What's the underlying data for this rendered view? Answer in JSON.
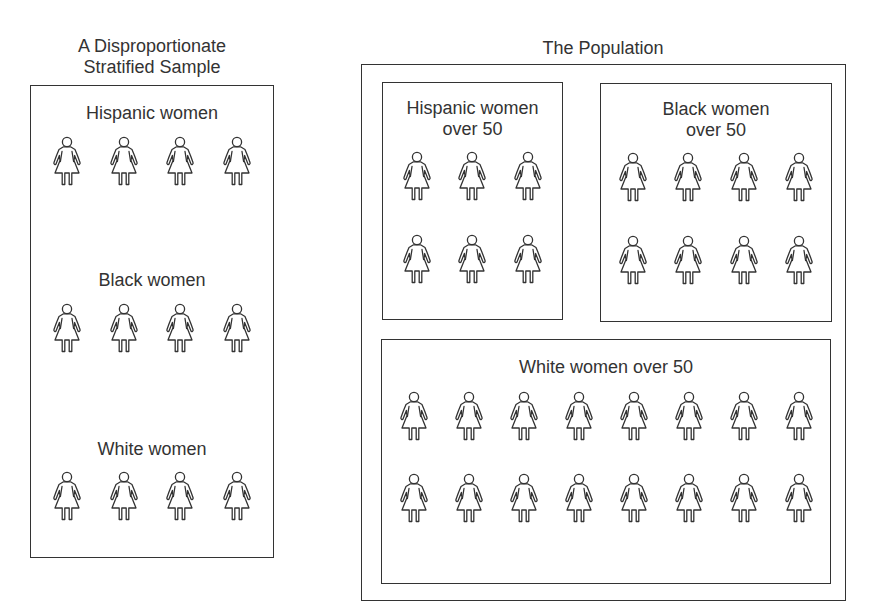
{
  "sample": {
    "title_line1": "A Disproportionate",
    "title_line2": "Stratified Sample",
    "groups": [
      {
        "label": "Hispanic women",
        "count": 4
      },
      {
        "label": "Black women",
        "count": 4
      },
      {
        "label": "White women",
        "count": 4
      }
    ]
  },
  "population": {
    "title": "The Population",
    "groups": [
      {
        "label_line1": "Hispanic women",
        "label_line2": "over 50",
        "rows": 2,
        "per_row": 3,
        "count": 6
      },
      {
        "label_line1": "Black women",
        "label_line2": "over 50",
        "rows": 2,
        "per_row": 4,
        "count": 8
      },
      {
        "label_line1": "White women over 50",
        "rows": 2,
        "per_row": 8,
        "count": 16
      }
    ]
  },
  "icons": {
    "person": "woman-figure-icon"
  },
  "colors": {
    "stroke": "#333333",
    "background": "#ffffff"
  }
}
